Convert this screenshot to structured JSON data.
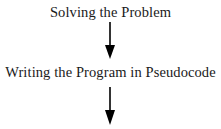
{
  "diagram": {
    "type": "flowchart",
    "direction": "top-to-bottom",
    "steps": [
      {
        "label": "Solving the Problem"
      },
      {
        "label": "Writing the Program in Pseudocode"
      }
    ],
    "arrows": [
      {
        "from": "Solving the Problem",
        "to": "Writing the Program in Pseudocode"
      },
      {
        "from": "Writing the Program in Pseudocode",
        "to": ""
      }
    ],
    "colors": {
      "text": "#1a1a1a",
      "arrow": "#000000",
      "background": "#ffffff"
    }
  }
}
